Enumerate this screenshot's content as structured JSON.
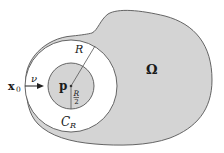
{
  "diagram": {
    "type": "geometric-figure",
    "colors": {
      "domain_fill": "#d4d4d4",
      "inner_disk_fill": "#d4d4d4",
      "annulus_fill": "#ffffff",
      "stroke": "#555555",
      "text": "#1a1a1a"
    },
    "labels": {
      "omega": "Ω",
      "radius": "R",
      "half_radius_num": "R",
      "half_radius_den": "2",
      "center_point": "p",
      "boundary_point_main": "x",
      "boundary_point_sub": "0",
      "normal_vector": "ν",
      "circle_main": "C",
      "circle_sub": "R"
    }
  }
}
